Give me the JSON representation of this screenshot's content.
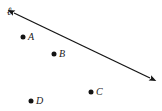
{
  "figure": {
    "kind": "geometry-diagram",
    "width": 162,
    "height": 111,
    "background_color": "#ffffff",
    "ink_color": "#141414"
  },
  "line": {
    "label": "ℓ",
    "label_x": 9,
    "label_y": 11,
    "arrow_style": "double-headed",
    "start_x": 14,
    "start_y": 13,
    "end_x": 150,
    "end_y": 78,
    "stroke_width": 1.3,
    "color": "#141414"
  },
  "points": [
    {
      "label": "A",
      "dot_x": 23,
      "dot_y": 37,
      "label_x": 28,
      "label_y": 37
    },
    {
      "label": "B",
      "dot_x": 54,
      "dot_y": 54,
      "label_x": 59,
      "label_y": 54
    },
    {
      "label": "C",
      "dot_x": 91,
      "dot_y": 92,
      "label_x": 96,
      "label_y": 92
    },
    {
      "label": "D",
      "dot_x": 31,
      "dot_y": 101,
      "label_x": 36,
      "label_y": 101
    }
  ]
}
